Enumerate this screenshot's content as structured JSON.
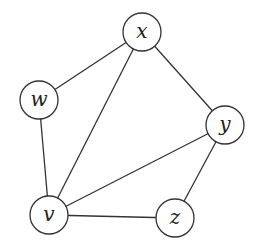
{
  "diagram": {
    "type": "undirected-graph",
    "node_radius": 19,
    "stroke_color": "#333333",
    "nodes": [
      {
        "id": "x",
        "label": "x",
        "cx": 142,
        "cy": 32
      },
      {
        "id": "w",
        "label": "w",
        "cx": 39,
        "cy": 100
      },
      {
        "id": "y",
        "label": "y",
        "cx": 225,
        "cy": 125
      },
      {
        "id": "v",
        "label": "v",
        "cx": 49,
        "cy": 215
      },
      {
        "id": "z",
        "label": "z",
        "cx": 175,
        "cy": 218
      }
    ],
    "edges": [
      {
        "from": "w",
        "to": "x"
      },
      {
        "from": "w",
        "to": "v"
      },
      {
        "from": "x",
        "to": "v"
      },
      {
        "from": "x",
        "to": "y"
      },
      {
        "from": "y",
        "to": "v"
      },
      {
        "from": "y",
        "to": "z"
      },
      {
        "from": "v",
        "to": "z"
      }
    ]
  }
}
